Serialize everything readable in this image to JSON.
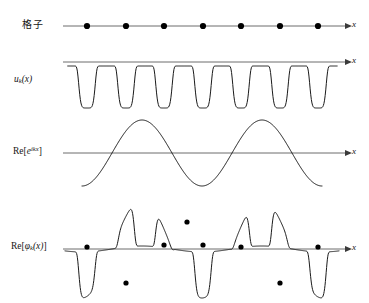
{
  "figure": {
    "background_color": "#ffffff",
    "curve_color": "#1a1a1a",
    "axis_color": "#5b5b5b",
    "dot_color": "#000000",
    "width": 369,
    "height": 303
  },
  "panels": [
    {
      "id": "lattice",
      "label": "格子",
      "label_kind": "cjk",
      "axis_label": "x",
      "axis_y": 26,
      "axis_x_start": 63,
      "axis_x_end": 345,
      "content_description": "one-dimensional lattice of seven evenly spaced ion sites on the x axis",
      "lattice_sites_x": [
        87,
        126,
        164,
        203,
        241,
        280,
        318
      ],
      "dot_radius": 3.1
    },
    {
      "id": "periodic-part",
      "label_parts": {
        "main": "u",
        "sub": "k",
        "arg": "(x)"
      },
      "label_kind": "math",
      "axis_label": "x",
      "axis_y": 62,
      "axis_x_start": 63,
      "axis_x_end": 345,
      "content_description": "periodic cell function u_k(x) with seven narrow wells dipping below the axis, one per lattice site",
      "well_centers_x": [
        87,
        126,
        164,
        203,
        241,
        280,
        318
      ],
      "well_depth": 42,
      "well_half_width": 11,
      "curve_top_offset": 4
    },
    {
      "id": "plane-wave",
      "label_parts": {
        "prefix": "Re[",
        "base": "e",
        "sup": "ikx",
        "suffix": "]"
      },
      "label_kind": "math",
      "axis_label": "x",
      "axis_y": 153,
      "axis_x_start": 63,
      "axis_x_end": 345,
      "content_description": "real part of the plane wave e^{ikx}, a cosine-like wave of about two periods",
      "wave_amplitude": 33,
      "wave_x_start": 82,
      "wave_x_end": 322,
      "wave_periods": 2.0,
      "wave_phase_deg": 180
    },
    {
      "id": "bloch-function",
      "label_parts": {
        "prefix": "Re[",
        "base": "φ",
        "sub": "k",
        "arg": "(x)",
        "suffix": "]"
      },
      "label_kind": "math",
      "axis_label": "x",
      "axis_y": 249,
      "axis_x_start": 63,
      "axis_x_end": 345,
      "content_description": "real part of the Bloch function phi_k(x): the product of u_k(x) and the plane wave, giving a tall upward spike at the centre, two deep downward spikes on either side and dots marking the lattice sites on the envelope",
      "marker_points": [
        {
          "x": 87,
          "y": 247
        },
        {
          "x": 126,
          "y": 283
        },
        {
          "x": 164,
          "y": 245
        },
        {
          "x": 187,
          "y": 222
        },
        {
          "x": 203,
          "y": 245
        },
        {
          "x": 241,
          "y": 247
        },
        {
          "x": 280,
          "y": 283
        },
        {
          "x": 318,
          "y": 247
        }
      ],
      "dot_radius": 2.6
    }
  ],
  "axis_label_text": "x"
}
